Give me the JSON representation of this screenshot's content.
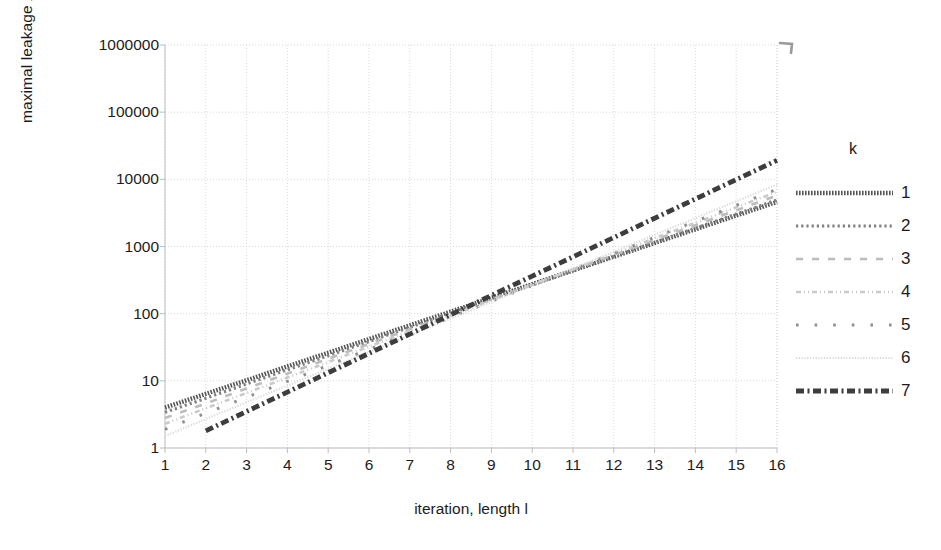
{
  "chart_data": {
    "type": "line",
    "title": "",
    "xlabel": "iteration, length l",
    "ylabel": "maximal leakage λ",
    "yscale": "log",
    "ylim": [
      1,
      1000000
    ],
    "xlim": [
      1,
      16
    ],
    "grid": true,
    "legend_position": "right",
    "legend_title": "k",
    "x": [
      1,
      2,
      3,
      4,
      5,
      6,
      7,
      8,
      9,
      10,
      11,
      12,
      13,
      14,
      15,
      16
    ],
    "ytick_labels": [
      "1000000",
      "100000",
      "10000",
      "1000",
      "100",
      "10",
      "1"
    ],
    "ytick_values": [
      1000000,
      100000,
      10000,
      1000,
      100,
      10,
      1
    ],
    "xtick_labels": [
      "1",
      "2",
      "3",
      "4",
      "5",
      "6",
      "7",
      "8",
      "9",
      "10",
      "11",
      "12",
      "13",
      "14",
      "15",
      "16"
    ],
    "series": [
      {
        "name": "1",
        "style": "dotted-heavy-dark",
        "color": "#595959",
        "values": [
          4.0,
          6.4,
          10.2,
          16.4,
          26.2,
          41.9,
          67.1,
          107,
          172,
          275,
          440,
          704,
          1126,
          1802,
          2883,
          4613
        ]
      },
      {
        "name": "2",
        "style": "zigzag-marker",
        "color": "#7f7f7f",
        "values": [
          3.4,
          5.5,
          9.0,
          14.6,
          23.7,
          38.5,
          62.6,
          102,
          165,
          268,
          436,
          708,
          1151,
          1870,
          3039,
          4939
        ]
      },
      {
        "name": "3",
        "style": "dashed-light",
        "color": "#b8b8b8",
        "values": [
          2.8,
          4.6,
          7.7,
          12.8,
          21.3,
          35.4,
          58.9,
          98,
          163,
          271,
          451,
          750,
          1248,
          2076,
          3453,
          5744
        ]
      },
      {
        "name": "4",
        "style": "dash-dot-dot-light",
        "color": "#cfcfcf",
        "values": [
          2.3,
          3.9,
          6.6,
          11.2,
          19.0,
          32.3,
          54.9,
          93,
          159,
          270,
          459,
          780,
          1326,
          2254,
          3832,
          6513
        ]
      },
      {
        "name": "5",
        "style": "sparse-square-marker",
        "color": "#8c8c8c",
        "values": [
          1.9,
          3.3,
          5.7,
          9.8,
          17.0,
          29.4,
          50.9,
          88,
          153,
          264,
          457,
          791,
          1370,
          2372,
          4107,
          7110
        ]
      },
      {
        "name": "6",
        "style": "dotted-fine-light",
        "color": "#dcdcdc",
        "values": [
          1.5,
          2.7,
          4.8,
          8.5,
          15.1,
          26.8,
          47.6,
          84,
          150,
          266,
          473,
          840,
          1492,
          2651,
          4710,
          8368
        ]
      },
      {
        "name": "7",
        "style": "dash-dot-heavy-dark",
        "color": "#404040",
        "values": [
          null,
          1.8,
          3.5,
          6.8,
          13.2,
          25.6,
          49.6,
          96,
          187,
          362,
          702,
          1360,
          2636,
          5108,
          9900,
          19188
        ]
      }
    ]
  },
  "plot_geometry": {
    "left": 165,
    "right": 777,
    "top": 45,
    "bottom": 448
  },
  "legend": {
    "title": "k",
    "rows": [
      {
        "label": "1",
        "swatch": "series-1-line-sample"
      },
      {
        "label": "2",
        "swatch": "series-2-line-sample"
      },
      {
        "label": "3",
        "swatch": "series-3-line-sample"
      },
      {
        "label": "4",
        "swatch": "series-4-line-sample"
      },
      {
        "label": "5",
        "swatch": "series-5-line-sample"
      },
      {
        "label": "6",
        "swatch": "series-6-line-sample"
      },
      {
        "label": "7",
        "swatch": "series-7-line-sample"
      }
    ]
  },
  "colors": {
    "axis": "#a6a6a6",
    "grid": "#d9d9d9",
    "text": "#1c1c1c",
    "background": "#ffffff"
  }
}
